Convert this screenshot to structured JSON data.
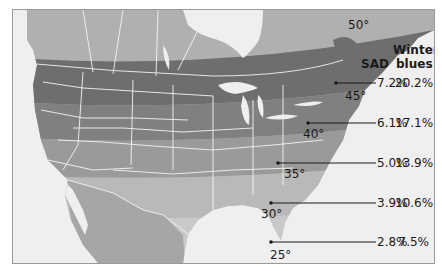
{
  "map": {
    "subject": "North America latitude bands vs. seasonal affective disorder prevalence",
    "headers": {
      "sad": "SAD",
      "winter_blues_line1": "Winter",
      "winter_blues_line2": "blues"
    },
    "latitudes": [
      {
        "label": "50°"
      },
      {
        "label": "45°"
      },
      {
        "label": "40°"
      },
      {
        "label": "35°"
      },
      {
        "label": "30°"
      },
      {
        "label": "25°"
      }
    ],
    "rows": [
      {
        "sad": "7.2%",
        "winter_blues": "20.2%"
      },
      {
        "sad": "6.1%",
        "winter_blues": "17.1%"
      },
      {
        "sad": "5.0%",
        "winter_blues": "13.9%"
      },
      {
        "sad": "3.9%",
        "winter_blues": "10.6%"
      },
      {
        "sad": "2.8%",
        "winter_blues": "7.5%"
      }
    ],
    "colors": {
      "water": "#efefef",
      "land_far_north": "#b0b0b0",
      "band_45_50": "#6e6e6e",
      "band_40_45": "#808080",
      "band_35_40": "#9a9a9a",
      "band_30_35": "#b9b9b9",
      "band_25_30": "#c9c9c9",
      "mexico": "#a6a6a6",
      "borders": "#f4f4f4",
      "leader_line": "#1a1a1a"
    }
  }
}
